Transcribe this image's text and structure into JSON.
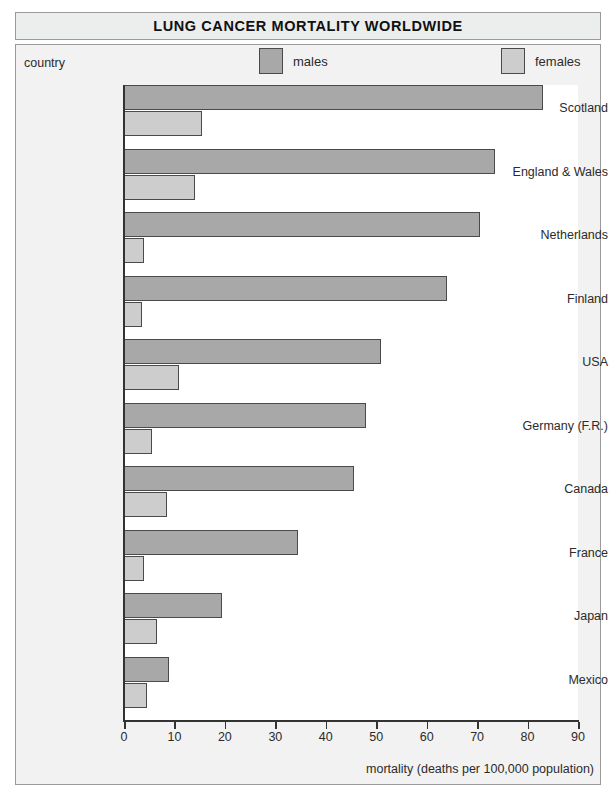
{
  "title": "LUNG CANCER MORTALITY WORLDWIDE",
  "legend": {
    "category_axis_label": "country",
    "males_label": "males",
    "females_label": "females",
    "males_color": "#a8a8a8",
    "females_color": "#cdcdcd"
  },
  "x_axis": {
    "caption": "mortality (deaths per 100,000 population)",
    "ticks": [
      "0",
      "10",
      "20",
      "30",
      "40",
      "50",
      "60",
      "70",
      "80",
      "90"
    ]
  },
  "chart_data": {
    "type": "bar",
    "title": "LUNG CANCER MORTALITY WORLDWIDE",
    "orientation": "horizontal",
    "xlabel": "mortality (deaths per 100,000 population)",
    "ylabel": "country",
    "xlim": [
      0,
      90
    ],
    "grid": false,
    "legend_position": "top",
    "categories": [
      "Scotland",
      "England & Wales",
      "Netherlands",
      "Finland",
      "USA",
      "Germany (F.R.)",
      "Canada",
      "France",
      "Japan",
      "Mexico"
    ],
    "series": [
      {
        "name": "males",
        "color": "#a8a8a8",
        "values": [
          83,
          73.5,
          70.5,
          64,
          51,
          48,
          45.5,
          34.5,
          19.5,
          9
        ]
      },
      {
        "name": "females",
        "color": "#cdcdcd",
        "values": [
          15.5,
          14,
          4,
          3.5,
          11,
          5.5,
          8.5,
          4,
          6.5,
          4.5
        ]
      }
    ]
  }
}
